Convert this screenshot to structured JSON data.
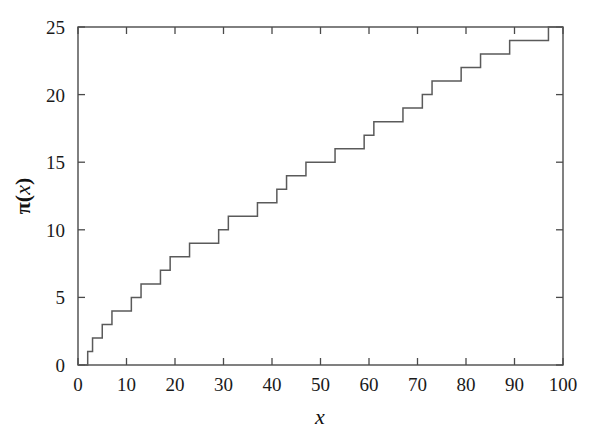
{
  "figure": {
    "background_color": "#ffffff",
    "line_color": "#5a5a5a",
    "axis_color": "#4a4a4a",
    "text_color": "#1a1a1a"
  },
  "axis_titles": {
    "y_pi": "π",
    "y_paren_open": "(",
    "y_var": "x",
    "y_paren_close": ")",
    "x": "x"
  },
  "chart_data": {
    "type": "line",
    "title": "",
    "subtitle": "",
    "xlabel": "x",
    "ylabel": "π(x)",
    "xlim": [
      0,
      100
    ],
    "ylim": [
      0,
      25
    ],
    "xticks": [
      0,
      10,
      20,
      30,
      40,
      50,
      60,
      70,
      80,
      90,
      100
    ],
    "yticks": [
      0,
      5,
      10,
      15,
      20,
      25
    ],
    "xtick_labels": [
      "0",
      "10",
      "20",
      "30",
      "40",
      "50",
      "60",
      "70",
      "80",
      "90",
      "100"
    ],
    "ytick_labels": [
      "0",
      "5",
      "10",
      "15",
      "20",
      "25"
    ],
    "grid": false,
    "legend": null,
    "drawstyle": "steps-post",
    "annotations": [],
    "series": [
      {
        "name": "π(x)",
        "description": "Prime-counting function: number of primes less than or equal to x",
        "color": "#5a5a5a",
        "linewidth": 1.5,
        "step_positions": [
          2,
          3,
          5,
          7,
          11,
          13,
          17,
          19,
          23,
          29,
          31,
          37,
          41,
          43,
          47,
          53,
          59,
          61,
          67,
          71,
          73,
          79,
          83,
          89,
          97
        ],
        "step_values": [
          1,
          2,
          3,
          4,
          5,
          6,
          7,
          8,
          9,
          10,
          11,
          12,
          13,
          14,
          15,
          16,
          17,
          18,
          19,
          20,
          21,
          22,
          23,
          24,
          25
        ],
        "x": [
          0,
          2,
          2,
          3,
          3,
          5,
          5,
          7,
          7,
          11,
          11,
          13,
          13,
          17,
          17,
          19,
          19,
          23,
          23,
          29,
          29,
          31,
          31,
          37,
          37,
          41,
          41,
          43,
          43,
          47,
          47,
          53,
          53,
          59,
          59,
          61,
          61,
          67,
          67,
          71,
          71,
          73,
          73,
          79,
          79,
          83,
          83,
          89,
          89,
          97,
          97,
          100
        ],
        "y": [
          0,
          0,
          1,
          1,
          2,
          2,
          3,
          3,
          4,
          4,
          5,
          5,
          6,
          6,
          7,
          7,
          8,
          8,
          9,
          9,
          10,
          10,
          11,
          11,
          12,
          12,
          13,
          13,
          14,
          14,
          15,
          15,
          16,
          16,
          17,
          17,
          18,
          18,
          19,
          19,
          20,
          20,
          21,
          21,
          22,
          22,
          23,
          23,
          24,
          24,
          25,
          25
        ]
      }
    ]
  }
}
